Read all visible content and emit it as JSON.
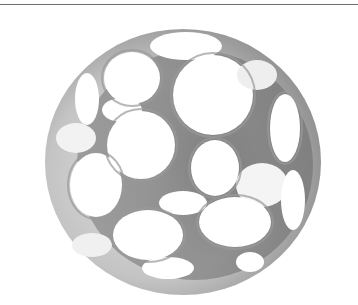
{
  "image": {
    "subject": "lattice-ball",
    "alt": "Grayscale photo of a hollow plastic ball with many circular openings",
    "colors": {
      "background": "#ffffff",
      "rule": "#6e6e6e",
      "ball_light": "#d2d2d2",
      "ball_mid": "#a8a8a8",
      "ball_dark": "#4a4a4a",
      "hole_inside": "#5a5a5a"
    }
  }
}
